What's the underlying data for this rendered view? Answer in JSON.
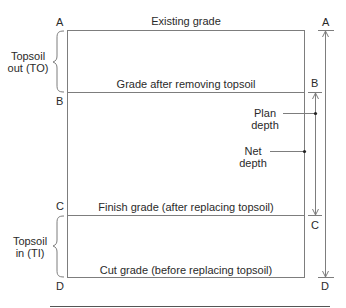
{
  "diagram": {
    "points": {
      "left": [
        "A",
        "B",
        "C",
        "D"
      ],
      "right": [
        "A",
        "B",
        "C",
        "D"
      ]
    },
    "grade_lines": {
      "existing": "Existing grade",
      "after_topsoil_removal": "Grade after removing topsoil",
      "finish": "Finish grade (after replacing topsoil)",
      "cut": "Cut grade (before replacing topsoil)"
    },
    "braces": {
      "topsoil_out_line1": "Topsoil",
      "topsoil_out_line2": "out (TO)",
      "topsoil_in_line1": "Topsoil",
      "topsoil_in_line2": "in (TI)"
    },
    "dimensions": {
      "plan_depth_line1": "Plan",
      "plan_depth_line2": "depth",
      "net_depth_line1": "Net",
      "net_depth_line2": "depth"
    },
    "colors": {
      "line": "#7a7a7a",
      "text": "#2a2a2a",
      "background": "#ffffff"
    }
  }
}
